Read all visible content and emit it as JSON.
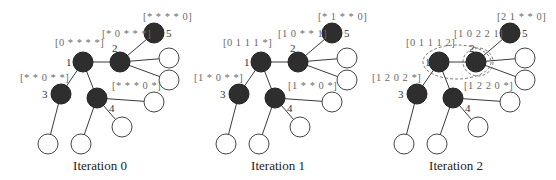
{
  "panels": [
    {
      "caption": "Iteration 0",
      "nodes": {
        "n1": {
          "label": "1",
          "vector": "[0 * * * *]"
        },
        "n2": {
          "label": "2",
          "vector": "[* 0 * * *]"
        },
        "n3": {
          "label": "3",
          "vector": "[* * 0 * *]"
        },
        "n4": {
          "label": "4",
          "vector": "[* * * 0 *]"
        },
        "n5": {
          "label": "5",
          "vector": "[* * * * 0]"
        }
      }
    },
    {
      "caption": "Iteration 1",
      "nodes": {
        "n1": {
          "label": "1",
          "vector": "[0 1 1 1 *]"
        },
        "n2": {
          "label": "2",
          "vector": "[1 0 * * 1]"
        },
        "n3": {
          "label": "3",
          "vector": "[1 * 0 * *]"
        },
        "n4": {
          "label": "4",
          "vector": "[1 * * 0 *]"
        },
        "n5": {
          "label": "5",
          "vector": "[* 1 * * 0]"
        }
      }
    },
    {
      "caption": "Iteration 2",
      "nodes": {
        "n1": {
          "label": "1",
          "vector": "[0 1 1 1 2]"
        },
        "n2": {
          "label": "2",
          "vector": "[1 0 2 2 1]"
        },
        "n3": {
          "label": "3",
          "vector": "[1 2 0 2 *]"
        },
        "n4": {
          "label": "4",
          "vector": "[1 2 2 0 *]"
        },
        "n5": {
          "label": "5",
          "vector": "[2 1 * * 0]"
        }
      }
    }
  ],
  "colors": {
    "landmark_node": "#2e2e2e",
    "regular_node": "#ffffff",
    "edge": "#3a3a3a",
    "vector_text": "#6a6a6a"
  }
}
